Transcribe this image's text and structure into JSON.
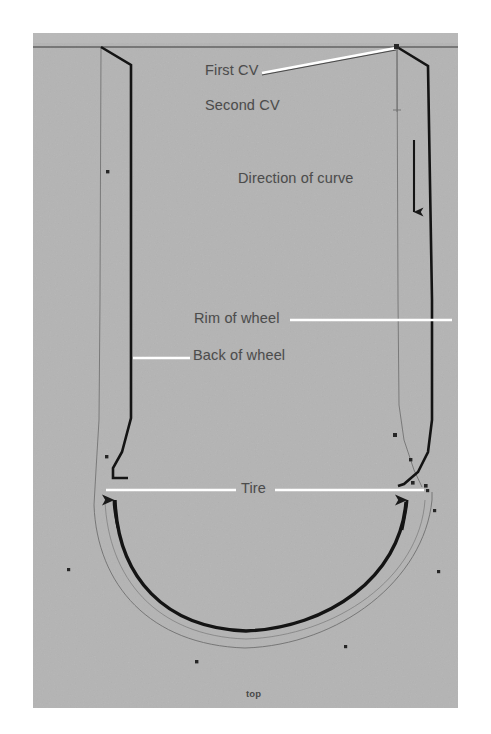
{
  "figure": {
    "canvas": {
      "width": 491,
      "height": 734,
      "plate_x": 33,
      "plate_y": 33,
      "plate_width": 425,
      "plate_height": 675,
      "background_color": "#ffffff",
      "plate_color": "#b3b3b3",
      "ink_color": "#1a1a1a",
      "leader_color": "#ffffff",
      "text_color": "#4c4c4c",
      "guide_color": "#6e6e6e"
    },
    "annotations": {
      "first_cv": "First CV",
      "second_cv": "Second CV",
      "direction_of_curve": "Direction of curve",
      "rim_of_wheel": "Rim of wheel",
      "back_of_wheel": "Back of wheel",
      "tire": "Tire",
      "orientation_bottom": "top"
    },
    "markers": {
      "cv_count_visible": 12,
      "cv_color": "#2b2b2b",
      "cv_size_px": 4
    },
    "arrows": {
      "direction_arrow": {
        "label": "Direction of curve",
        "orientation": "down",
        "x": 414,
        "y_start": 140,
        "y_end": 222
      },
      "tire_arc_arrow_left": {
        "orientation": "up",
        "x": 114,
        "y": 497
      },
      "tire_arc_arrow_right": {
        "orientation": "up",
        "x": 408,
        "y": 497
      }
    }
  }
}
